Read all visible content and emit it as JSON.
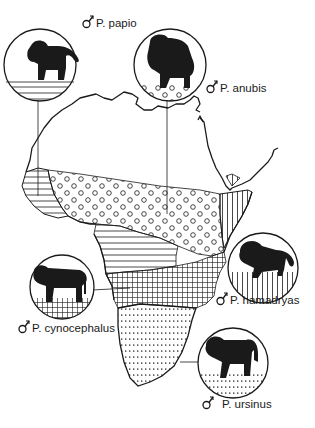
{
  "figure": {
    "colors": {
      "ink": "#1a1a1a",
      "background": "#ffffff"
    },
    "species": [
      {
        "id": "papio",
        "label": "P. papio",
        "symbol": "male-symbol",
        "pattern": "horizontal-lines",
        "region": "West Africa (Senegal/Guinea)"
      },
      {
        "id": "anubis",
        "label": "P. anubis",
        "symbol": "male-symbol",
        "pattern": "open-circles",
        "region": "Sahel / Central Africa belt"
      },
      {
        "id": "hamadryas",
        "label": "P. hamadryas",
        "symbol": "male-symbol",
        "pattern": "vertical-lines",
        "region": "Horn of Africa / Arabia"
      },
      {
        "id": "cynocephalus",
        "label": "P. cynocephalus",
        "symbol": "male-symbol",
        "pattern": "crosshatch-grid",
        "region": "East/Central-South Africa"
      },
      {
        "id": "ursinus",
        "label": "P. ursinus",
        "symbol": "male-symbol",
        "pattern": "dotted-lines",
        "region": "Southern Africa"
      }
    ]
  }
}
